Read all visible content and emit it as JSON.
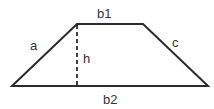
{
  "diagram": {
    "stroke_color": "#2b2b2b",
    "labels": {
      "top_base": "b1",
      "bottom_base": "b2",
      "left_side": "a",
      "right_side": "c",
      "height": "h"
    }
  }
}
